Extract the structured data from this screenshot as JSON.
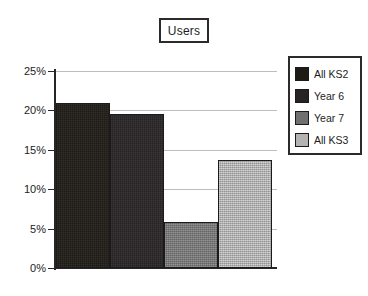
{
  "title": {
    "text": "Users"
  },
  "legend": {
    "position": "right",
    "entries": [
      {
        "label": "All KS2",
        "color": "#1e1a16"
      },
      {
        "label": "Year 6",
        "color": "#272324"
      },
      {
        "label": "Year 7",
        "color": "#707070"
      },
      {
        "label": "All KS3",
        "color": "#b3b3b3"
      }
    ]
  },
  "axis": {
    "y_ticks": [
      "0%",
      "5%",
      "10%",
      "15%",
      "20%",
      "25%"
    ]
  },
  "chart_data": {
    "type": "bar",
    "title": "Users",
    "xlabel": "",
    "ylabel": "",
    "categories": [
      "All KS2",
      "Year 6",
      "Year 7",
      "All KS3"
    ],
    "values": [
      21.0,
      19.5,
      5.8,
      13.7
    ],
    "series": [
      {
        "name": "Users",
        "values": [
          21.0,
          19.5,
          5.8,
          13.7
        ]
      }
    ],
    "ylim": [
      0,
      25
    ],
    "ytick_values": [
      0,
      5,
      10,
      15,
      20,
      25
    ],
    "ytick_labels": [
      "0%",
      "5%",
      "10%",
      "15%",
      "20%",
      "25%"
    ],
    "units": "percent",
    "grid": true,
    "grid_axis": "y",
    "legend": true,
    "legend_position": "right",
    "bar_colors": [
      "#1e1a16",
      "#272324",
      "#707070",
      "#b3b3b3"
    ]
  }
}
